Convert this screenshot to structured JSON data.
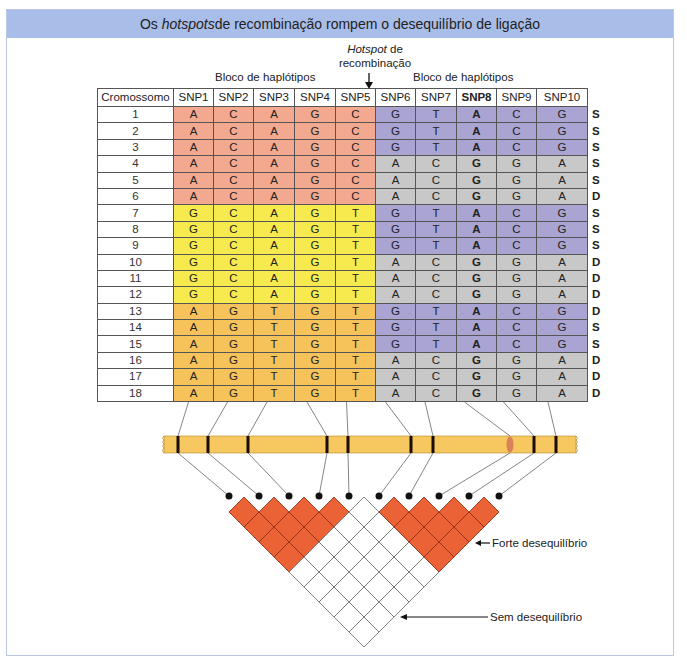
{
  "title": {
    "prefix": "Os ",
    "italic": "hotspots",
    "suffix": " de recombinação rompem o desequilíbrio de ligação"
  },
  "hotspot_label": {
    "italic": "Hotspot",
    "line1_suffix": " de",
    "line2": "recombinação"
  },
  "block_labels": [
    "Bloco de haplótipos",
    "Bloco de haplótipos"
  ],
  "table": {
    "headers": [
      "Cromossomo",
      "SNP1",
      "SNP2",
      "SNP3",
      "SNP4",
      "SNP5",
      "SNP6",
      "SNP7",
      "SNP8",
      "SNP9",
      "SNP10"
    ],
    "bold_column": "SNP8",
    "rows": [
      {
        "chr": "1",
        "left": [
          "A",
          "C",
          "A",
          "G",
          "C"
        ],
        "right": [
          "G",
          "T",
          "A",
          "C",
          "G"
        ],
        "status": "S",
        "left_color": "#f2a98f",
        "right_color": "#a9a4d2"
      },
      {
        "chr": "2",
        "left": [
          "A",
          "C",
          "A",
          "G",
          "C"
        ],
        "right": [
          "G",
          "T",
          "A",
          "C",
          "G"
        ],
        "status": "S",
        "left_color": "#f2a98f",
        "right_color": "#a9a4d2"
      },
      {
        "chr": "3",
        "left": [
          "A",
          "C",
          "A",
          "G",
          "C"
        ],
        "right": [
          "G",
          "T",
          "A",
          "C",
          "G"
        ],
        "status": "S",
        "left_color": "#f2a98f",
        "right_color": "#a9a4d2"
      },
      {
        "chr": "4",
        "left": [
          "A",
          "C",
          "A",
          "G",
          "C"
        ],
        "right": [
          "A",
          "C",
          "G",
          "G",
          "A"
        ],
        "status": "S",
        "left_color": "#f2a98f",
        "right_color": "#c8c8c8"
      },
      {
        "chr": "5",
        "left": [
          "A",
          "C",
          "A",
          "G",
          "C"
        ],
        "right": [
          "A",
          "C",
          "G",
          "G",
          "A"
        ],
        "status": "S",
        "left_color": "#f2a98f",
        "right_color": "#c8c8c8"
      },
      {
        "chr": "6",
        "left": [
          "A",
          "C",
          "A",
          "G",
          "C"
        ],
        "right": [
          "A",
          "C",
          "G",
          "G",
          "A"
        ],
        "status": "D",
        "left_color": "#f2a98f",
        "right_color": "#c8c8c8"
      },
      {
        "chr": "7",
        "left": [
          "G",
          "C",
          "A",
          "G",
          "T"
        ],
        "right": [
          "G",
          "T",
          "A",
          "C",
          "G"
        ],
        "status": "S",
        "left_color": "#f7ea4e",
        "right_color": "#a9a4d2"
      },
      {
        "chr": "8",
        "left": [
          "G",
          "C",
          "A",
          "G",
          "T"
        ],
        "right": [
          "G",
          "T",
          "A",
          "C",
          "G"
        ],
        "status": "S",
        "left_color": "#f7ea4e",
        "right_color": "#a9a4d2"
      },
      {
        "chr": "9",
        "left": [
          "G",
          "C",
          "A",
          "G",
          "T"
        ],
        "right": [
          "G",
          "T",
          "A",
          "C",
          "G"
        ],
        "status": "S",
        "left_color": "#f7ea4e",
        "right_color": "#a9a4d2"
      },
      {
        "chr": "10",
        "left": [
          "G",
          "C",
          "A",
          "G",
          "T"
        ],
        "right": [
          "A",
          "C",
          "G",
          "G",
          "A"
        ],
        "status": "D",
        "left_color": "#f7ea4e",
        "right_color": "#c8c8c8"
      },
      {
        "chr": "11",
        "left": [
          "G",
          "C",
          "A",
          "G",
          "T"
        ],
        "right": [
          "A",
          "C",
          "G",
          "G",
          "A"
        ],
        "status": "D",
        "left_color": "#f7ea4e",
        "right_color": "#c8c8c8"
      },
      {
        "chr": "12",
        "left": [
          "G",
          "C",
          "A",
          "G",
          "T"
        ],
        "right": [
          "A",
          "C",
          "G",
          "G",
          "A"
        ],
        "status": "D",
        "left_color": "#f7ea4e",
        "right_color": "#c8c8c8"
      },
      {
        "chr": "13",
        "left": [
          "A",
          "G",
          "T",
          "G",
          "T"
        ],
        "right": [
          "G",
          "T",
          "A",
          "C",
          "G"
        ],
        "status": "D",
        "left_color": "#f6c25a",
        "right_color": "#a9a4d2"
      },
      {
        "chr": "14",
        "left": [
          "A",
          "G",
          "T",
          "G",
          "T"
        ],
        "right": [
          "G",
          "T",
          "A",
          "C",
          "G"
        ],
        "status": "S",
        "left_color": "#f6c25a",
        "right_color": "#a9a4d2"
      },
      {
        "chr": "15",
        "left": [
          "A",
          "G",
          "T",
          "G",
          "T"
        ],
        "right": [
          "G",
          "T",
          "A",
          "C",
          "G"
        ],
        "status": "S",
        "left_color": "#f6c25a",
        "right_color": "#a9a4d2"
      },
      {
        "chr": "16",
        "left": [
          "A",
          "G",
          "T",
          "G",
          "T"
        ],
        "right": [
          "A",
          "C",
          "G",
          "G",
          "A"
        ],
        "status": "D",
        "left_color": "#f6c25a",
        "right_color": "#c8c8c8"
      },
      {
        "chr": "17",
        "left": [
          "A",
          "G",
          "T",
          "G",
          "T"
        ],
        "right": [
          "A",
          "C",
          "G",
          "G",
          "A"
        ],
        "status": "D",
        "left_color": "#f6c25a",
        "right_color": "#c8c8c8"
      },
      {
        "chr": "18",
        "left": [
          "A",
          "G",
          "T",
          "G",
          "T"
        ],
        "right": [
          "A",
          "C",
          "G",
          "G",
          "A"
        ],
        "status": "D",
        "left_color": "#f6c25a",
        "right_color": "#c8c8c8"
      }
    ]
  },
  "chromosome": {
    "color": "#f6c85f",
    "hotspot_color": "#d9825a",
    "snp_positions_x": [
      178,
      208,
      248,
      327,
      348,
      411,
      433,
      510,
      534,
      556
    ],
    "hotspot_snp_index": 7
  },
  "ld_plot": {
    "blocks": [
      [
        1,
        5
      ],
      [
        6,
        10
      ]
    ],
    "strong_color": "#ec6237",
    "legend": {
      "strong": "Forte desequilíbrio",
      "none": "Sem desequilíbrio"
    }
  }
}
